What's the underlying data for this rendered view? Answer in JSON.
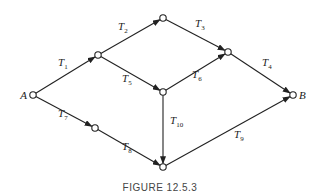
{
  "figure": {
    "caption": "FIGURE 12.5.3",
    "nodes": [
      {
        "id": "A",
        "label": "A"
      },
      {
        "id": "n1",
        "label": ""
      },
      {
        "id": "n2",
        "label": ""
      },
      {
        "id": "n3",
        "label": ""
      },
      {
        "id": "n5",
        "label": ""
      },
      {
        "id": "n7",
        "label": ""
      },
      {
        "id": "n10",
        "label": ""
      },
      {
        "id": "B",
        "label": "B"
      }
    ],
    "edges": [
      {
        "from": "A",
        "to": "n1",
        "label": "T",
        "sub": "1"
      },
      {
        "from": "n1",
        "to": "n2",
        "label": "T",
        "sub": "2"
      },
      {
        "from": "n2",
        "to": "n3",
        "label": "T",
        "sub": "3"
      },
      {
        "from": "n3",
        "to": "B",
        "label": "T",
        "sub": "4"
      },
      {
        "from": "n1",
        "to": "n5",
        "label": "T",
        "sub": "5"
      },
      {
        "from": "n5",
        "to": "n3",
        "label": "T",
        "sub": "6"
      },
      {
        "from": "A",
        "to": "n7",
        "label": "T",
        "sub": "7"
      },
      {
        "from": "n7",
        "to": "n10",
        "label": "T",
        "sub": "8"
      },
      {
        "from": "n10",
        "to": "B",
        "label": "T",
        "sub": "9"
      },
      {
        "from": "n5",
        "to": "n10",
        "label": "T",
        "sub": "10"
      }
    ]
  }
}
